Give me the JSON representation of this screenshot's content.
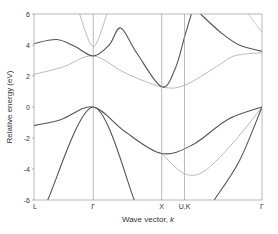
{
  "chart_data": {
    "type": "line",
    "title": "",
    "xlabel": "Wave vector, k",
    "ylabel": "Relative energy (eV)",
    "ylim": [
      -6,
      6
    ],
    "yticks": [
      6,
      4,
      2,
      0,
      -2,
      -4,
      -6
    ],
    "xticks": [
      {
        "label": "L",
        "pos": 0.0
      },
      {
        "label": "Γ",
        "pos": 0.26
      },
      {
        "label": "X",
        "pos": 0.56
      },
      {
        "label": "U,K",
        "pos": 0.66
      },
      {
        "label": "Γ",
        "pos": 1.0
      }
    ],
    "grid": "vertical lines at high-symmetry points",
    "legend": null,
    "series": [
      {
        "name": "conduction band 1 (dark)",
        "color": "#555555",
        "points": [
          [
            0.0,
            4.1
          ],
          [
            0.1,
            4.35
          ],
          [
            0.18,
            3.9
          ],
          [
            0.26,
            3.3
          ],
          [
            0.33,
            4.0
          ],
          [
            0.38,
            5.1
          ],
          [
            0.45,
            3.5
          ],
          [
            0.56,
            1.3
          ],
          [
            0.62,
            2.5
          ],
          [
            0.66,
            4.5
          ],
          [
            0.69,
            6.0
          ]
        ]
      },
      {
        "name": "conduction band 2 (light)",
        "color": "#bbbbbb",
        "points": [
          [
            0.0,
            2.1
          ],
          [
            0.13,
            2.6
          ],
          [
            0.26,
            3.3
          ],
          [
            0.4,
            2.2
          ],
          [
            0.56,
            1.3
          ],
          [
            0.66,
            1.4
          ],
          [
            0.8,
            2.6
          ],
          [
            0.88,
            3.3
          ],
          [
            1.0,
            3.5
          ]
        ]
      },
      {
        "name": "conduction band 3 (light)",
        "color": "#bbbbbb",
        "points": [
          [
            0.2,
            6.0
          ],
          [
            0.26,
            3.9
          ],
          [
            0.32,
            6.0
          ]
        ]
      },
      {
        "name": "conduction band 4 (dark)",
        "color": "#555555",
        "points": [
          [
            0.73,
            6.0
          ],
          [
            0.82,
            4.8
          ],
          [
            0.9,
            4.0
          ],
          [
            1.0,
            3.6
          ]
        ]
      },
      {
        "name": "conduction band 5 (light)",
        "color": "#cccccc",
        "points": [
          [
            0.94,
            6.0
          ],
          [
            1.0,
            4.8
          ]
        ]
      },
      {
        "name": "valence band 1 (dark)",
        "color": "#555555",
        "points": [
          [
            0.0,
            -1.2
          ],
          [
            0.12,
            -0.8
          ],
          [
            0.26,
            0.0
          ],
          [
            0.4,
            -1.6
          ],
          [
            0.56,
            -3.0
          ],
          [
            0.7,
            -2.4
          ],
          [
            0.85,
            -0.8
          ],
          [
            1.0,
            0.0
          ]
        ]
      },
      {
        "name": "valence band 2 (dark)",
        "color": "#555555",
        "points": [
          [
            0.06,
            -6.0
          ],
          [
            0.26,
            0.0
          ],
          [
            0.44,
            -6.0
          ]
        ]
      },
      {
        "name": "valence band 3 (dark)",
        "color": "#555555",
        "points": [
          [
            0.79,
            -6.0
          ],
          [
            0.9,
            -3.5
          ],
          [
            1.0,
            0.0
          ]
        ]
      },
      {
        "name": "valence band 4 (light)",
        "color": "#bbbbbb",
        "points": [
          [
            0.56,
            -3.0
          ],
          [
            0.66,
            -4.3
          ],
          [
            0.75,
            -4.1
          ],
          [
            0.88,
            -2.2
          ],
          [
            1.0,
            0.0
          ]
        ]
      }
    ]
  },
  "labels": {
    "ylabel": "Relative energy (eV)",
    "xlabel_prefix": "Wave vector, ",
    "xlabel_k": "k"
  }
}
